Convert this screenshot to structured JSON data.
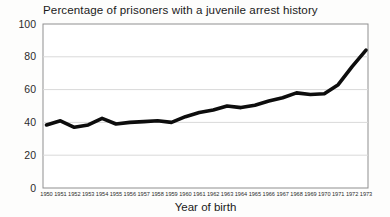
{
  "chart": {
    "title": "Percentage of prisoners with a juvenile arrest history",
    "xlabel": "Year of birth"
  },
  "chart_data": {
    "type": "line",
    "title": "Percentage of prisoners with a juvenile arrest history",
    "xlabel": "Year of birth",
    "ylabel": "",
    "categories": [
      "1950",
      "1951",
      "1952",
      "1953",
      "1954",
      "1955",
      "1956",
      "1957",
      "1958",
      "1959",
      "1960",
      "1961",
      "1962",
      "1963",
      "1964",
      "1965",
      "1966",
      "1967",
      "1968",
      "1969",
      "1970",
      "1971",
      "1972",
      "1973"
    ],
    "values": [
      38.5,
      41,
      37,
      38.5,
      42.5,
      39,
      40,
      40.5,
      41,
      40,
      43.5,
      46,
      47.5,
      50,
      49,
      50.5,
      53,
      55,
      58,
      57,
      57.5,
      63,
      74,
      84
    ],
    "ylim": [
      0,
      100
    ],
    "yticks": [
      0,
      20,
      40,
      60,
      80,
      100
    ],
    "grid": true,
    "legend": "none",
    "line_color": "#0d0d0d",
    "grid_color": "#d9d9d9",
    "box_color": "#8f8f8f",
    "tick_label_color": "#2b2b2b"
  }
}
